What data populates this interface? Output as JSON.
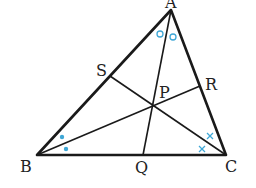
{
  "diagram": {
    "type": "triangle-angle-bisectors",
    "vertices": {
      "A": {
        "label": "A",
        "x": 171,
        "y": 10
      },
      "B": {
        "label": "B",
        "x": 37,
        "y": 155
      },
      "C": {
        "label": "C",
        "x": 226,
        "y": 155
      }
    },
    "points": {
      "P": {
        "label": "P",
        "x": 153,
        "y": 105
      },
      "Q": {
        "label": "Q",
        "x": 143,
        "y": 155
      },
      "R": {
        "label": "R",
        "x": 200,
        "y": 86
      },
      "S": {
        "label": "S",
        "x": 110,
        "y": 76
      }
    },
    "segments": [
      "AB",
      "BC",
      "CA",
      "AQ",
      "BR",
      "CS"
    ],
    "angle_marks": {
      "A": {
        "symbol": "circle",
        "count": 2
      },
      "B": {
        "symbol": "dot",
        "count": 2
      },
      "C": {
        "symbol": "cross",
        "count": 2
      }
    },
    "colors": {
      "lines": "#1a1a1a",
      "marks": "#3fa7d6"
    }
  }
}
